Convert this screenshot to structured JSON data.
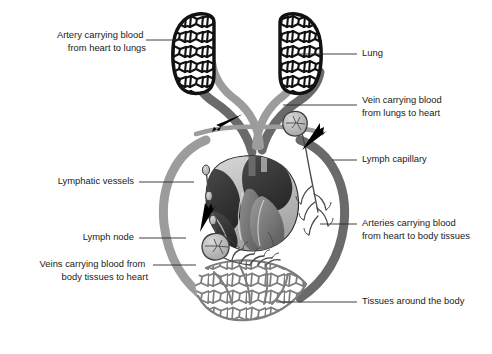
{
  "diagram": {
    "canvas": {
      "width": 492,
      "height": 354,
      "background": "#ffffff"
    },
    "palette": {
      "outline": "#111111",
      "vessel_light": "#9c9c9c",
      "vessel_dark": "#6a6a6a",
      "capillary": "#7d7d7d",
      "lymph_line": "#4a4a4a",
      "lymph_fill": "#b9b9b9",
      "heart_dark": "#3b3b3b",
      "heart_mid": "#7a7a7a",
      "heart_light": "#c9c9c9",
      "arrow": "#000000",
      "text": "#1a1a1a",
      "leader": "#2b2b2b"
    },
    "labels": [
      {
        "id": "artery-to-lungs",
        "lines": [
          "Artery carrying blood",
          "from heart to lungs"
        ],
        "align": "right",
        "text_x": 141,
        "text_y": 40,
        "leader": "M146,40 L186,40"
      },
      {
        "id": "lung",
        "lines": [
          "Lung"
        ],
        "align": "left",
        "text_x": 362,
        "text_y": 54,
        "leader": "M300,54 L357,54"
      },
      {
        "id": "vein-from-lungs",
        "lines": [
          "Vein carrying blood",
          "from lungs to heart"
        ],
        "align": "left",
        "text_x": 362,
        "text_y": 105,
        "leader": "M283,105 L357,105"
      },
      {
        "id": "lymph-capillary",
        "lines": [
          "Lymph capillary"
        ],
        "align": "left",
        "text_x": 362,
        "text_y": 160,
        "leader": "M332,160 L357,160"
      },
      {
        "id": "lymphatic-vessels",
        "lines": [
          "Lymphatic vessels"
        ],
        "align": "right",
        "text_x": 134,
        "text_y": 182,
        "leader": "M139,182 L194,182"
      },
      {
        "id": "lymph-node",
        "lines": [
          "Lymph node"
        ],
        "align": "right",
        "text_x": 134,
        "text_y": 238,
        "leader": "M139,238 L186,238"
      },
      {
        "id": "arteries-to-body",
        "lines": [
          "Arteries carrying blood",
          "from heart to body tissues"
        ],
        "align": "left",
        "text_x": 362,
        "text_y": 230,
        "leader": "M320,224 L357,224"
      },
      {
        "id": "veins-from-body",
        "lines": [
          "Veins carrying blood from",
          "body tissues to heart"
        ],
        "align": "right",
        "text_x": 148,
        "text_y": 271,
        "leader": "M153,265 L196,265"
      },
      {
        "id": "tissues-around-body",
        "lines": [
          "Tissues around the body"
        ],
        "align": "left",
        "text_x": 362,
        "text_y": 302,
        "leader": "M276,302 L357,302"
      }
    ],
    "flow_arrows": [
      {
        "id": "flow-arrow-left-top",
        "direction": "left",
        "x": 226,
        "y": 121,
        "angle": 202
      },
      {
        "id": "flow-arrow-right-top",
        "direction": "up-right",
        "x": 318,
        "y": 130,
        "angle": -62
      },
      {
        "id": "flow-arrow-lymph-up",
        "direction": "up",
        "x": 203,
        "y": 212,
        "angle": -80
      }
    ],
    "organs": [
      {
        "id": "lung-left",
        "name": "Lung (left)"
      },
      {
        "id": "lung-right",
        "name": "Lung (right)"
      },
      {
        "id": "heart",
        "name": "Heart cross-section"
      },
      {
        "id": "tissue-capillary-bed",
        "name": "Tissues around the body"
      },
      {
        "id": "lymph-node-left",
        "name": "Lymph node (left)"
      },
      {
        "id": "lymph-node-right",
        "name": "Lymph node (right)"
      }
    ]
  }
}
